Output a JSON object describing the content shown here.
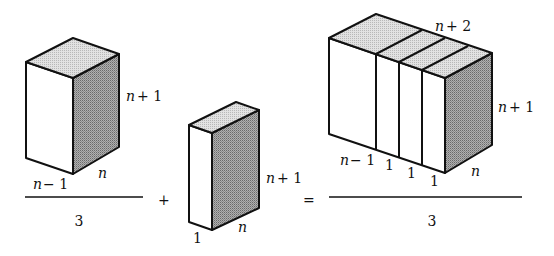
{
  "figure": {
    "left_term": {
      "labels": {
        "height": "n + 1",
        "depth": "n",
        "width": "n − 1"
      },
      "denominator": "3"
    },
    "plus": "+",
    "middle_term": {
      "labels": {
        "height": "n + 1",
        "depth": "n",
        "width": "1"
      }
    },
    "equals": "=",
    "right_term": {
      "labels": {
        "top": "n + 2",
        "height": "n + 1",
        "depth": "n",
        "widths": [
          "n − 1",
          "1",
          "1",
          "1"
        ]
      },
      "denominator": "3"
    },
    "colors": {
      "stroke": "#111111",
      "top_face": "#d4d4d4",
      "side_face": "#9a9a9a",
      "front_face": "#ffffff"
    }
  }
}
